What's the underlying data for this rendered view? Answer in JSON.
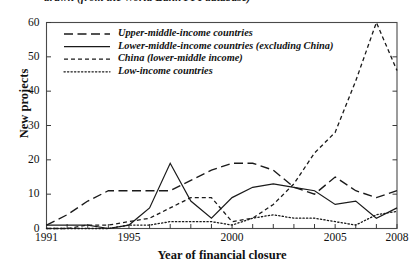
{
  "caption": {
    "clipped_text": "drawn (from the World Bank PPI database)"
  },
  "axes": {
    "ylabel": "New projects",
    "xlabel": "Year of financial closure",
    "yticks": [
      "0",
      "10",
      "20",
      "30",
      "40",
      "50",
      "60"
    ],
    "xticks": [
      "1991",
      "1995",
      "2000",
      "2005",
      "2008"
    ]
  },
  "legend": {
    "items": [
      {
        "label": "Upper-middle-income countries",
        "style": "long-dash"
      },
      {
        "label": "Lower-middle-income countries (excluding China)",
        "style": "solid"
      },
      {
        "label": "China (lower-middle income)",
        "style": "short-dash"
      },
      {
        "label": "Low-income countries",
        "style": "dotted"
      }
    ]
  },
  "chart_data": {
    "type": "line",
    "title": "",
    "xlabel": "Year of financial closure",
    "ylabel": "New projects",
    "xlim": [
      1991,
      2008
    ],
    "ylim": [
      0,
      60
    ],
    "grid": false,
    "legend_position": "upper-left-inside",
    "x": [
      1991,
      1992,
      1993,
      1994,
      1995,
      1996,
      1997,
      1998,
      1999,
      2000,
      2001,
      2002,
      2003,
      2004,
      2005,
      2006,
      2007,
      2008
    ],
    "series": [
      {
        "name": "Upper-middle-income countries",
        "dash": "long-dash",
        "values": [
          1,
          4,
          8,
          11,
          11,
          11,
          11,
          14,
          17,
          19,
          19,
          17,
          12,
          10,
          15,
          11,
          9,
          11
        ]
      },
      {
        "name": "Lower-middle-income countries (excluding China)",
        "dash": "solid",
        "values": [
          1,
          1,
          1,
          0,
          1,
          6,
          19,
          8,
          3,
          9,
          12,
          13,
          12,
          11,
          7,
          8,
          3,
          6
        ]
      },
      {
        "name": "China (lower-middle income)",
        "dash": "short-dash",
        "values": [
          0,
          0,
          1,
          1,
          2,
          3,
          6,
          9,
          9,
          2,
          3,
          7,
          13,
          22,
          28,
          43,
          60,
          46
        ]
      },
      {
        "name": "Low-income countries",
        "dash": "dotted",
        "values": [
          0,
          0,
          0,
          0,
          1,
          1,
          2,
          2,
          2,
          1,
          3,
          4,
          3,
          3,
          2,
          1,
          4,
          5
        ]
      }
    ]
  }
}
